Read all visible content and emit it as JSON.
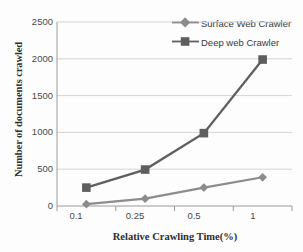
{
  "chart_data": {
    "type": "line",
    "title": "",
    "xlabel": "Relative Crawling Time(%)",
    "ylabel": "Number of documents crawled",
    "categories": [
      "0.1",
      "0.25",
      "0.5",
      "1"
    ],
    "ylim": [
      0,
      2500
    ],
    "yticks": [
      0,
      500,
      1000,
      1500,
      2000,
      2500
    ],
    "ytick_labels": [
      "0",
      "500",
      "1000",
      "1500",
      "2000",
      "2500"
    ],
    "grid": "horizontal",
    "legend_position": "top-right",
    "series": [
      {
        "name": "Surface Web Crawler",
        "values": [
          25,
          100,
          250,
          390
        ],
        "color": "#8c8c8c",
        "marker": "diamond"
      },
      {
        "name": "Deep web Crawler",
        "values": [
          250,
          495,
          990,
          1990
        ],
        "color": "#5f5f5f",
        "marker": "square"
      }
    ]
  },
  "colors": {
    "background": "#fdfdfd",
    "gridline": "#d4d4d4",
    "axis": "#9a9a9a",
    "text": "#3a3a3a",
    "series_surface": "#8c8c8c",
    "series_deep": "#5f5f5f"
  }
}
